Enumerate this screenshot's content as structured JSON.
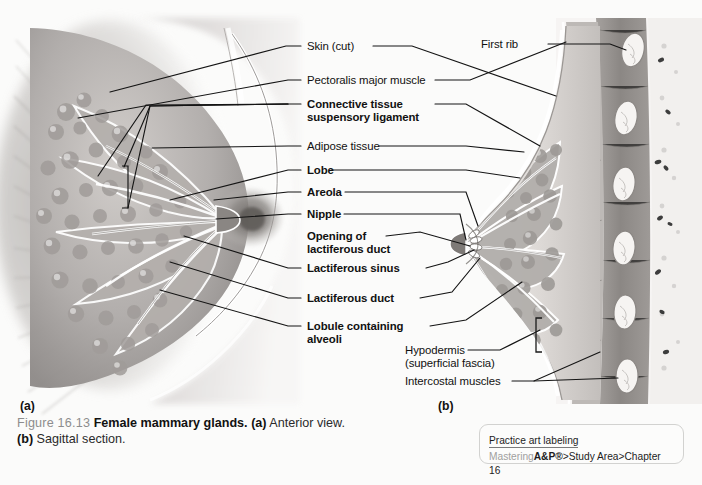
{
  "figure": {
    "number": "Figure 16.13",
    "title": "Female mammary glands.",
    "part_a_tag": "(a)",
    "part_a_text": "Anterior view.",
    "part_b_tag": "(b)",
    "part_b_text": "Sagittal section."
  },
  "panels": {
    "a": {
      "letter": "(a)",
      "view": "Anterior view"
    },
    "b": {
      "letter": "(b)",
      "view": "Sagittal section"
    }
  },
  "labels": {
    "skin_cut": "Skin (cut)",
    "pectoralis": "Pectoralis major muscle",
    "connective_l1": "Connective tissue",
    "connective_l2": "suspensory ligament",
    "adipose": "Adipose tissue",
    "lobe": "Lobe",
    "areola": "Areola",
    "nipple": "Nipple",
    "opening_l1": "Opening of",
    "opening_l2": "lactiferous duct",
    "lactiferous_sinus": "Lactiferous sinus",
    "lactiferous_duct": "Lactiferous duct",
    "lobule_l1": "Lobule containing",
    "lobule_l2": "alveoli",
    "first_rib": "First rib",
    "hypodermis_l1": "Hypodermis",
    "hypodermis_l2": "(superficial fascia)",
    "intercostal": "Intercostal muscles"
  },
  "practice_box": {
    "heading": "Practice art labeling",
    "path_prefix": "Mastering",
    "path_brand": "A&P®",
    "path_rest": ">Study Area>Chapter 16"
  },
  "colors": {
    "page_background": "#fbfbfa",
    "label_text": "#111111",
    "leader_line": "#141414",
    "caption_number": "#8d8d8d",
    "practice_border": "#d2d2d0",
    "practice_grey_text": "#a0a09e"
  }
}
